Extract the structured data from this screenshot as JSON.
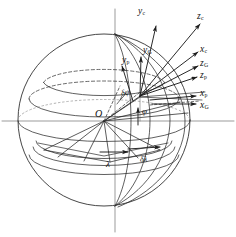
{
  "figure": {
    "type": "geodetic-reference-frames-sphere",
    "colors": {
      "stroke": "#262626",
      "background": "#ffffff",
      "dashed": "#3a3a3a"
    }
  },
  "labels": {
    "origin": {
      "text": "O",
      "sub": ""
    },
    "phi": {
      "text": "φ",
      "sub": ""
    },
    "delta_phi": {
      "text": "δφ",
      "sub": ""
    },
    "lambda": {
      "text": "λ",
      "sub": ""
    },
    "delta_lambda": {
      "text": "δλ",
      "sub": ""
    },
    "y_c": {
      "text": "y",
      "sub": "c"
    },
    "z_c": {
      "text": "z",
      "sub": "c"
    },
    "x_c": {
      "text": "x",
      "sub": "c"
    },
    "y_G": {
      "text": "y",
      "sub": "G"
    },
    "z_G": {
      "text": "z",
      "sub": "G"
    },
    "x_G": {
      "text": "x",
      "sub": "G"
    },
    "y_p": {
      "text": "y",
      "sub": "p"
    },
    "z_p": {
      "text": "z",
      "sub": "p"
    },
    "x_p": {
      "text": "x",
      "sub": "p"
    }
  }
}
